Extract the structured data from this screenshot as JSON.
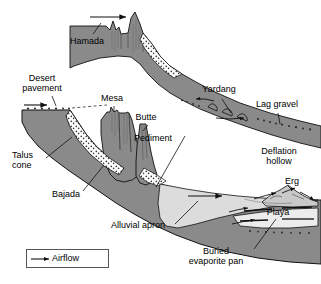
{
  "figure": {
    "type": "block-diagram",
    "background_color": "#ffffff",
    "bedrock_color": "#8a8a8a",
    "sand_color": "#d9d9d9",
    "playa_color": "#e8e8e8",
    "line_color": "#000000",
    "leader_color": "#000000"
  },
  "labels": [
    {
      "id": "hamada",
      "text": "Hamada",
      "x": 70,
      "y": 36
    },
    {
      "id": "desert-pavement",
      "text": "Desert\npavement",
      "x": 32,
      "y": 78
    },
    {
      "id": "mesa",
      "text": "Mesa",
      "x": 106,
      "y": 99
    },
    {
      "id": "butte",
      "text": "Butte",
      "x": 139,
      "y": 118
    },
    {
      "id": "pediment",
      "text": "Pediment",
      "x": 146,
      "y": 139
    },
    {
      "id": "yardang",
      "text": "Yardang",
      "x": 211,
      "y": 90
    },
    {
      "id": "lag-gravel",
      "text": "Lag gravel",
      "x": 256,
      "y": 104
    },
    {
      "id": "deflation-hollow",
      "text": "Deflation\nhollow",
      "x": 262,
      "y": 152
    },
    {
      "id": "erg",
      "text": "Erg",
      "x": 288,
      "y": 181
    },
    {
      "id": "playa",
      "text": "Playa",
      "x": 272,
      "y": 212
    },
    {
      "id": "talus-cone",
      "text": "Talus\ncone",
      "x": 24,
      "y": 155
    },
    {
      "id": "bajada",
      "text": "Bajada",
      "x": 62,
      "y": 194
    },
    {
      "id": "alluvial-apron",
      "text": "Alluvial apron",
      "x": 124,
      "y": 225
    },
    {
      "id": "buried-evaporite",
      "text": "Buried\nevaporite pan",
      "x": 208,
      "y": 253
    }
  ],
  "legend": {
    "arrow_symbol": "airflow-arrow",
    "label": "Airflow"
  },
  "airflow_arrows": [
    {
      "id": "arrow-top",
      "x1": 90,
      "y1": 17,
      "x2": 127,
      "y2": 17
    },
    {
      "id": "arrow-pavement",
      "x1": 24,
      "y1": 105,
      "x2": 48,
      "y2": 105
    },
    {
      "id": "arrow-yardang-1",
      "x1": 213,
      "y1": 101,
      "x2": 196,
      "y2": 99
    },
    {
      "id": "arrow-yardang-2",
      "x1": 215,
      "y1": 117,
      "x2": 245,
      "y2": 118
    },
    {
      "id": "arrow-basin",
      "x1": 188,
      "y1": 196,
      "x2": 223,
      "y2": 196
    },
    {
      "id": "arrow-erg-1",
      "x1": 255,
      "y1": 198,
      "x2": 277,
      "y2": 193
    },
    {
      "id": "arrow-erg-2",
      "x1": 283,
      "y1": 192,
      "x2": 296,
      "y2": 188
    },
    {
      "id": "arrow-erg-3",
      "x1": 300,
      "y1": 192,
      "x2": 315,
      "y2": 199
    },
    {
      "id": "arrow-playa-1",
      "x1": 230,
      "y1": 211,
      "x2": 249,
      "y2": 208
    },
    {
      "id": "arrow-playa-2",
      "x1": 233,
      "y1": 223,
      "x2": 256,
      "y2": 220
    }
  ]
}
